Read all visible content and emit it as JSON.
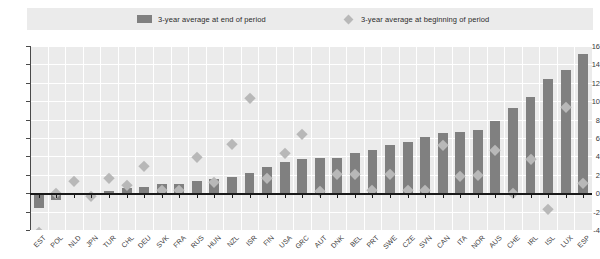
{
  "legend": {
    "items": [
      {
        "label": "3-year average at end of period",
        "marker": "bar-swatch-icon",
        "color": "#808080"
      },
      {
        "label": "3-year average at beginning of period",
        "marker": "diamond-swatch-icon",
        "color": "#b8b8b8"
      }
    ]
  },
  "chart_data": {
    "type": "bar",
    "title": "",
    "subtitle": "",
    "xlabel": "",
    "ylabel": "",
    "ylim": [
      -4,
      16
    ],
    "ytick_step": 2,
    "yticks": [
      -4,
      -2,
      0,
      2,
      4,
      6,
      8,
      10,
      12,
      14,
      16
    ],
    "grid": true,
    "legend_position": "top",
    "categories": [
      "EST",
      "POL",
      "NLD",
      "JPN",
      "TUR",
      "CHL",
      "DEU",
      "SVK",
      "FRA",
      "RUS",
      "HUN",
      "NZL",
      "ISR",
      "FIN",
      "USA",
      "GRC",
      "AUT",
      "DNK",
      "BEL",
      "PRT",
      "SWE",
      "CZE",
      "SVN",
      "CAN",
      "ITA",
      "NOR",
      "AUS",
      "CHE",
      "IRL",
      "ISL",
      "LUX",
      "ESP"
    ],
    "series": [
      {
        "name": "3-year average at end of period",
        "marker": "bar",
        "color": "#808080",
        "values": [
          -1.6,
          -0.7,
          -0.1,
          -0.1,
          0.2,
          0.6,
          0.7,
          1.0,
          1.0,
          1.3,
          1.5,
          1.8,
          2.2,
          2.9,
          3.4,
          3.7,
          3.8,
          3.8,
          4.4,
          4.7,
          5.2,
          5.6,
          6.1,
          6.5,
          6.6,
          6.9,
          7.8,
          9.3,
          10.5,
          12.4,
          13.4,
          15.1
        ]
      },
      {
        "name": "3-year average at beginning of period",
        "marker": "diamond",
        "color": "#b8b8b8",
        "values": [
          -4.2,
          0.0,
          1.3,
          -0.3,
          1.6,
          0.9,
          3.0,
          0.3,
          0.4,
          3.9,
          1.2,
          5.4,
          10.4,
          1.6,
          4.4,
          6.4,
          0.2,
          2.1,
          2.1,
          0.4,
          2.1,
          0.3,
          0.4,
          5.2,
          1.9,
          2.0,
          4.7,
          0.0,
          3.7,
          -1.7,
          9.4,
          1.1
        ]
      }
    ]
  }
}
